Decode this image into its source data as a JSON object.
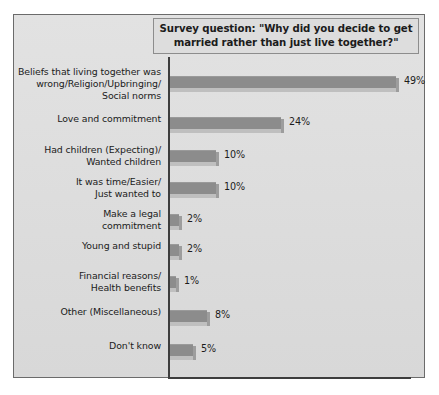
{
  "title": {
    "line1": "Survey question: \"Why did you decide to get",
    "line2": "married rather than just live together?\"",
    "full": "Survey question: \"Why did you decide to get\nmarried rather than just live together?\""
  },
  "colors": {
    "frame_border": "#6b6b6b",
    "panel_background": "#dcdcdc",
    "title_box_background": "#dddddd",
    "bar_fill": "#8c8c8c",
    "bar_shelf": "#bfbfbf",
    "axis": "#3d3d3d",
    "text": "#1b1b1b"
  },
  "chart_data": {
    "type": "bar",
    "orientation": "horizontal",
    "title": "Survey question: \"Why did you decide to get married rather than just live together?\"",
    "xlabel": "",
    "ylabel": "",
    "xlim": [
      0,
      55
    ],
    "grid": false,
    "legend": false,
    "value_suffix": "%",
    "categories": [
      "Beliefs that living together was\nwrong/Religion/Upbringing/\nSocial norms",
      "Love and commitment",
      "Had children (Expecting)/\nWanted children",
      "It was time/Easier/\nJust wanted to",
      "Make a legal\ncommitment",
      "Young and stupid",
      "Financial reasons/\nHealth benefits",
      "Other (Miscellaneous)",
      "Don't know"
    ],
    "values": [
      49,
      24,
      10,
      10,
      2,
      2,
      1,
      8,
      5
    ],
    "labels": [
      "49%",
      "24%",
      "10%",
      "10%",
      "2%",
      "2%",
      "1%",
      "8%",
      "5%"
    ]
  }
}
